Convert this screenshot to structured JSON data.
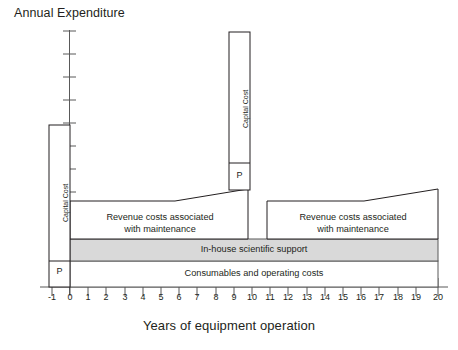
{
  "chart_data": {
    "type": "area",
    "title": "",
    "ylabel": "Annual Expenditure",
    "xlabel": "Years of equipment operation",
    "grid": false,
    "legend": "none",
    "xlim": [
      -1,
      20
    ],
    "xticks": [
      "-1",
      "0",
      "1",
      "2",
      "3",
      "4",
      "5",
      "6",
      "7",
      "8",
      "9",
      "10",
      "11",
      "12",
      "13",
      "14",
      "15",
      "16",
      "17",
      "18",
      "19",
      "20"
    ],
    "y_axis_ticks_count": 10,
    "y_axis_tick_labels": [],
    "series": [
      {
        "name": "Consumables and operating costs",
        "label": "Consumables and operating costs",
        "type": "band",
        "x_start": 0,
        "x_end": 20,
        "y_bottom": 0,
        "y_top": 1,
        "fill": "#ffffff",
        "stroke": "#595959"
      },
      {
        "name": "In-house scientific support",
        "label": "In-house scientific support",
        "type": "band",
        "x_start": 0,
        "x_end": 20,
        "y_bottom": 1,
        "y_top": 2,
        "fill": "#d9d9d9",
        "stroke": "#595959"
      },
      {
        "name": "Revenue costs associated with maintenance (cycle 1)",
        "label": "Revenue costs associated\nwith maintenance",
        "label_line1": "Revenue costs associated",
        "label_line2": "with maintenance",
        "type": "trapezoid",
        "x_start": 0,
        "x_flat_end": 6,
        "x_end": 10,
        "y_bottom": 2,
        "y_top_flat": 3.2,
        "y_top_end": 4.6,
        "fill": "#ffffff",
        "stroke": "#231f20"
      },
      {
        "name": "Revenue costs associated with maintenance (cycle 2)",
        "label_line1": "Revenue costs associated",
        "label_line2": "with maintenance",
        "type": "trapezoid",
        "x_start": 11,
        "x_flat_end": 16,
        "x_end": 20,
        "y_bottom": 2,
        "y_top_flat": 3.2,
        "y_top_end": 4.6,
        "fill": "#ffffff",
        "stroke": "#231f20"
      },
      {
        "name": "Capital Cost (initial purchase, year -1)",
        "label": "Capital Cost",
        "p_label": "P",
        "type": "bar",
        "x_start": -1,
        "x_end": 0,
        "y_bottom": 0,
        "y_top": 7.2,
        "p_segment_y_top": 1.05,
        "fill": "#ffffff",
        "stroke": "#231f20"
      },
      {
        "name": "Capital Cost (replacement, year 10)",
        "label": "Capital Cost",
        "p_label": "P",
        "type": "bar",
        "x_start": 9.4,
        "x_end": 10.4,
        "y_bottom": 2,
        "y_top": 13.2,
        "p_segment_y_top": 3.3,
        "fill": "#ffffff",
        "stroke": "#231f20"
      }
    ]
  },
  "axes": {
    "y_title": "Annual Expenditure",
    "x_title": "Years of equipment operation"
  },
  "labels": {
    "capital_cost": "Capital Cost",
    "p": "P",
    "in_house": "In-house scientific support",
    "consumables": "Consumables and operating costs",
    "revenue_line1": "Revenue costs associated",
    "revenue_line2": "with maintenance"
  },
  "colors": {
    "band_gray": "#d9d9d9",
    "stroke_dark": "#231f20",
    "stroke_mid": "#595959",
    "background": "#ffffff",
    "text": "#231f20"
  },
  "xticks": [
    "-1",
    "0",
    "1",
    "2",
    "3",
    "4",
    "5",
    "6",
    "7",
    "8",
    "9",
    "10",
    "11",
    "12",
    "13",
    "14",
    "15",
    "16",
    "17",
    "18",
    "19",
    "20"
  ]
}
